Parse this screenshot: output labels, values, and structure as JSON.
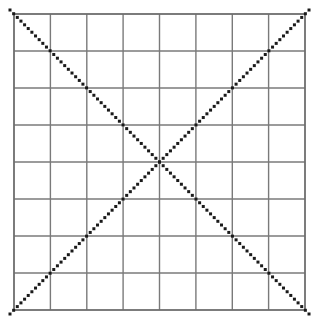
{
  "figure": {
    "title": "",
    "caption": "",
    "background_color": "#ffffff"
  },
  "grid": {
    "label": "grid",
    "rows": 8,
    "columns": 8,
    "left": 14,
    "top": 14,
    "right": 305,
    "bottom": 310,
    "cell_width": 36.375,
    "cell_height": 37.0,
    "line_color": "#7a7a7a",
    "line_width": 1.4,
    "border_color": "#6e6e6e",
    "border_width": 1.8,
    "x_positions": [
      14,
      50.4,
      86.8,
      123.1,
      159.5,
      195.9,
      232.3,
      268.6,
      305
    ],
    "y_positions": [
      14,
      51,
      88,
      125,
      162,
      199,
      236,
      273,
      310
    ]
  },
  "diagonals": [
    {
      "name": "diagonal-top-left-to-bottom-right",
      "x1": 10,
      "y1": 10,
      "x2": 311,
      "y2": 316,
      "color": "#1a1a1a",
      "dot_size": 3.0,
      "dot_gap": 2.2
    },
    {
      "name": "diagonal-bottom-left-to-top-right",
      "x1": 10,
      "y1": 314,
      "x2": 311,
      "y2": 8,
      "color": "#1a1a1a",
      "dot_size": 3.0,
      "dot_gap": 2.2
    }
  ],
  "center_point": {
    "label": "diagonal-intersection",
    "x": 160,
    "y": 162
  },
  "artifacts": {
    "corner_smudge": {
      "label": "scan-smudge",
      "x": 1,
      "y": 5
    }
  },
  "chart_data": {
    "type": "scatter",
    "title": "",
    "xlabel": "",
    "ylabel": "",
    "grid": true,
    "legend": "none",
    "xlim": [
      0,
      8
    ],
    "ylim": [
      0,
      8
    ],
    "xticks": [
      0,
      1,
      2,
      3,
      4,
      5,
      6,
      7,
      8
    ],
    "yticks": [
      0,
      1,
      2,
      3,
      4,
      5,
      6,
      7,
      8
    ],
    "xticklabels": [
      "",
      "",
      "",
      "",
      "",
      "",
      "",
      "",
      ""
    ],
    "yticklabels": [
      "",
      "",
      "",
      "",
      "",
      "",
      "",
      "",
      ""
    ],
    "series": [
      {
        "name": "diagonal-descending",
        "style": "dotted",
        "color": "#1a1a1a",
        "x": [
          0,
          1,
          2,
          3,
          4,
          5,
          6,
          7,
          8
        ],
        "y": [
          8,
          7,
          6,
          5,
          4,
          3,
          2,
          1,
          0
        ]
      },
      {
        "name": "diagonal-ascending",
        "style": "dotted",
        "color": "#1a1a1a",
        "x": [
          0,
          1,
          2,
          3,
          4,
          5,
          6,
          7,
          8
        ],
        "y": [
          0,
          1,
          2,
          3,
          4,
          5,
          6,
          7,
          8
        ]
      }
    ],
    "annotations": [
      {
        "text": "",
        "x": 4,
        "y": 4,
        "note": "diagonals intersect at grid center (4,4)"
      }
    ]
  }
}
